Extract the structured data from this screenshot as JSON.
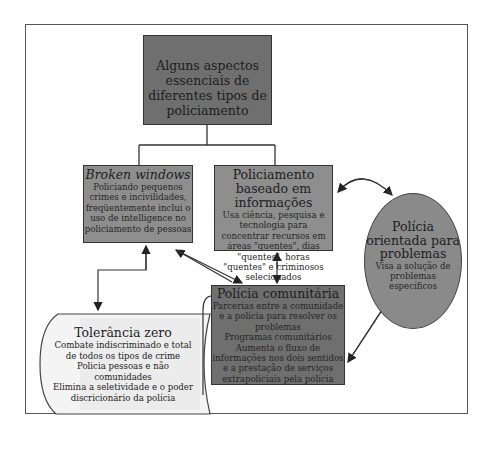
{
  "diagram": {
    "root": {
      "label": "Alguns aspectos essenciais de diferentes tipos de policiamento"
    },
    "broken_windows": {
      "title": "Broken windows",
      "description": "Policiando pequenos crimes e incivilidades, freqüentemente inclui o uso de intelligence no policiamento de pessoas"
    },
    "info_policing": {
      "title": "Policiamento baseado em informações",
      "description": "Usa ciência, pesquisa e tecnologia para concentrar recursos em áreas \"quentes\", dias \"quentes\", horas \"quentes\" e criminosos selecionados"
    },
    "problem_oriented": {
      "title": "Polícia orientada para problemas",
      "description": "Visa a solução de problemas específicos"
    },
    "community": {
      "title": "Polícia comunitária",
      "lines": [
        "Parcerias entre a comunidade e a polícia para resolver os problemas",
        "Programas comunitários",
        "Aumenta o fluxo de informações nos dois sentidos e a prestação de serviços extrapoliciais pela polícia"
      ]
    },
    "zero_tolerance": {
      "title": "Tolerância zero",
      "lines": [
        "Combate indiscriminado e total de todos os tipos de crime",
        "Policia pessoas e não comunidades",
        "Elimina a seletividade e o poder discricionário da polícia"
      ]
    },
    "colors": {
      "root_fill": "#6f6f6f",
      "box_fill": "#8e8e8e",
      "circle_fill": "#8a8a8a",
      "scroll_fill": "#f2f2f2",
      "line": "#333333"
    }
  }
}
